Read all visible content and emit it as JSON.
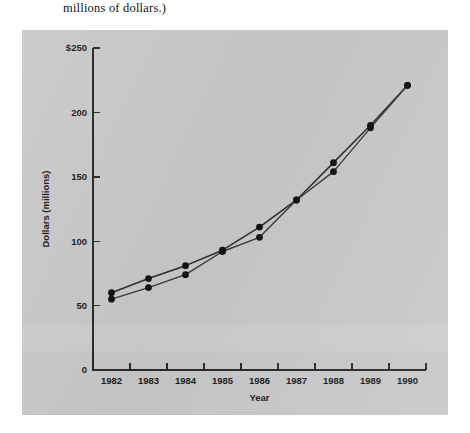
{
  "caption": {
    "text": "millions of dollars.)"
  },
  "figure": {
    "background_color": "#c9c9c9",
    "page_background_color": "#ffffff"
  },
  "chart_data": {
    "type": "line",
    "title": "",
    "xlabel": "Year",
    "ylabel": "Dollars (millions)",
    "x": [
      1982,
      1983,
      1984,
      1985,
      1986,
      1987,
      1988,
      1989,
      1990
    ],
    "xtick_labels": [
      "1982",
      "1983",
      "1984",
      "1985",
      "1986",
      "1987",
      "1988",
      "1989",
      "1990"
    ],
    "ytick_labels": [
      "0",
      "50",
      "100",
      "150",
      "200",
      "$250"
    ],
    "ytick_values": [
      0,
      50,
      100,
      150,
      200,
      250
    ],
    "ylim": [
      0,
      250
    ],
    "xlim": [
      1981.5,
      1990.5
    ],
    "grid": false,
    "legend": "none",
    "series": [
      {
        "name": "series-upper",
        "color": "#2b2b2b",
        "marker": "circle",
        "values": [
          60,
          71,
          81,
          93,
          111,
          132,
          161,
          190,
          221
        ]
      },
      {
        "name": "series-lower",
        "color": "#3a3a3a",
        "marker": "circle",
        "values": [
          55,
          64,
          74,
          92,
          103,
          132,
          154,
          188,
          221
        ]
      }
    ]
  }
}
